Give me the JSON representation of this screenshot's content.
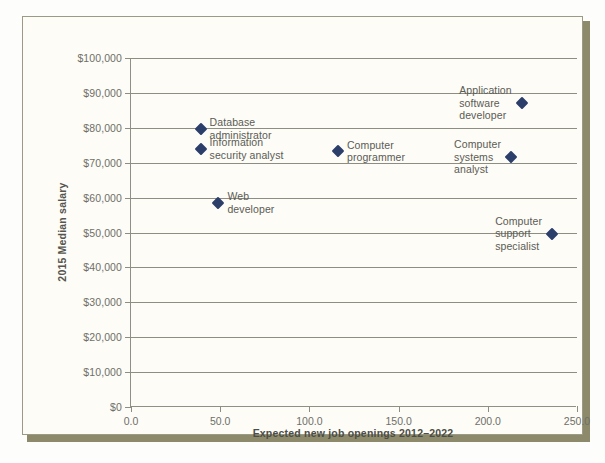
{
  "chart_data": {
    "type": "scatter",
    "title": "",
    "xlabel": "Expected new job openings 2012–2022",
    "ylabel": "2015 Median salary",
    "xlim": [
      0,
      250
    ],
    "ylim": [
      0,
      100000
    ],
    "xticks": [
      "0.0",
      "50.0",
      "100.0",
      "150.0",
      "200.0",
      "250.0"
    ],
    "yticks": [
      "$0",
      "$10,000",
      "$20,000",
      "$30,000",
      "$40,000",
      "$50,000",
      "$60,000",
      "$70,000",
      "$80,000",
      "$90,000",
      "$100,000"
    ],
    "grid": "horizontal",
    "legend": "none",
    "marker_color": "#2c3f6b",
    "marker_shape": "diamond",
    "points": [
      {
        "label": "Database\nadministrator",
        "x": 39,
        "y": 79700,
        "label_side": "right"
      },
      {
        "label": "Information\nsecurity analyst",
        "x": 39,
        "y": 74000,
        "label_side": "right"
      },
      {
        "label": "Web\ndeveloper",
        "x": 49,
        "y": 58500,
        "label_side": "right"
      },
      {
        "label": "Computer\nprogrammer",
        "x": 116,
        "y": 73300,
        "label_side": "right"
      },
      {
        "label": "Application\nsoftware\ndeveloper",
        "x": 219,
        "y": 87100,
        "label_side": "left"
      },
      {
        "label": "Computer\nsystems\nanalyst",
        "x": 213,
        "y": 71700,
        "label_side": "left"
      },
      {
        "label": "Computer\nsupport\nspecialist",
        "x": 236,
        "y": 49700,
        "label_side": "left"
      }
    ]
  }
}
